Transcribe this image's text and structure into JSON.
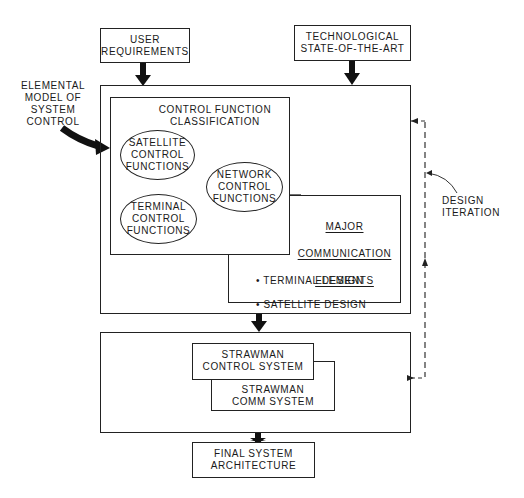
{
  "diagram": {
    "inputs": {
      "user_requirements": "USER\nREQUIREMENTS",
      "technological": "TECHNOLOGICAL\nSTATE-OF-THE-ART"
    },
    "side_label": "ELEMENTAL\nMODEL OF\nSYSTEM\nCONTROL",
    "control_function": {
      "title": "CONTROL FUNCTION\nCLASSIFICATION",
      "ellipses": [
        "SATELLITE\nCONTROL\nFUNCTIONS",
        "NETWORK\nCONTROL\nFUNCTIONS",
        "TERMINAL\nCONTROL\nFUNCTIONS"
      ]
    },
    "major_comm": {
      "title_lines": [
        "MAJOR",
        "COMMUNICATION",
        "ELEMENTS"
      ],
      "bullets": [
        "• TERMINAL DESIGN",
        "• SATELLITE DESIGN"
      ]
    },
    "design_iteration": "DESIGN\nITERATION",
    "strawman": {
      "control": "STRAWMAN\nCONTROL SYSTEM",
      "comm": "STRAWMAN\nCOMM SYSTEM"
    },
    "final": "FINAL SYSTEM\nARCHITECTURE"
  }
}
